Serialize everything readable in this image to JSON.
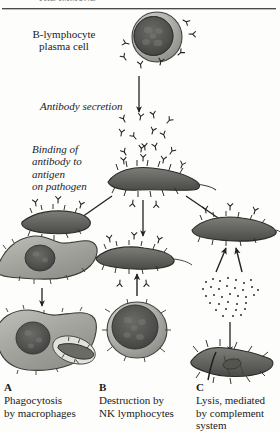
{
  "figure": {
    "running_head": "THE IMMUNE",
    "title_cut_off": true,
    "background_color": "#fdfdfc",
    "ink_color": "#1b1b1b"
  },
  "labels": {
    "plasma_cell": "B-lymphocyte\nplasma cell",
    "antibody_secretion": "Antibody secretion",
    "binding": "Binding of\nantibody to\nantigen\non pathogen"
  },
  "captions": [
    {
      "letter": "A",
      "text": "Phagocytosis\nby macrophages"
    },
    {
      "letter": "B",
      "text": "Destruction by\nNK lymphocytes"
    },
    {
      "letter": "C",
      "text": "Lysis, mediated\nby complement\nsystem"
    }
  ],
  "structures": {
    "plasma_cell_name": "plasma-cell",
    "antibody_name": "antibody-y-glyph",
    "pathogen_name": "pathogen-bacterium",
    "macrophage_name": "macrophage-cell",
    "nk_lymphocyte_name": "nk-lymphocyte-cell",
    "complement_name": "complement-protein-cluster",
    "lysed_pathogen_name": "lysed-pathogen"
  },
  "colors": {
    "cytoplasm": "#9a9a96",
    "nucleus": "#565653",
    "pathogen_body": "#6d6d69",
    "outline": "#2f2f2d",
    "arrow": "#232321"
  }
}
